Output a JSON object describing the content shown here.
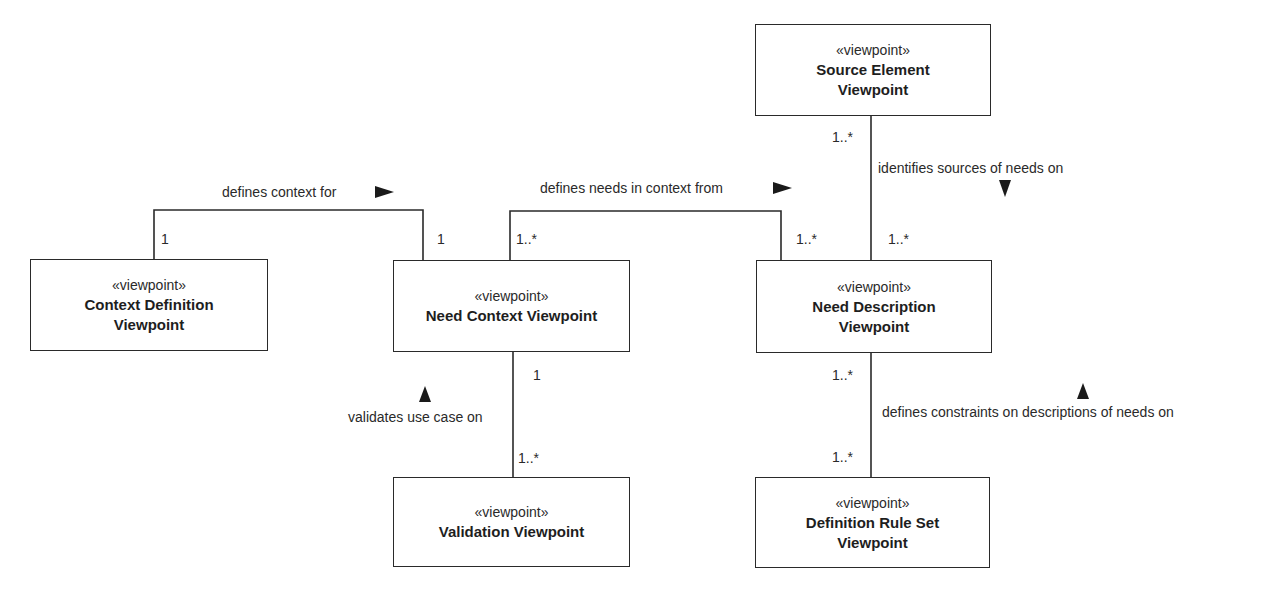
{
  "diagram": {
    "type": "uml-viewpoint-relationships",
    "stereotype": "«viewpoint»",
    "colors": {
      "line": "#2a2a2a",
      "text": "#1e1e1e",
      "background": "#ffffff",
      "arrow": "#1a1a1a"
    },
    "nodes": [
      {
        "id": "context_definition",
        "name": "Context Definition\nViewpoint"
      },
      {
        "id": "need_context",
        "name": "Need Context Viewpoint"
      },
      {
        "id": "source_element",
        "name": "Source Element\nViewpoint"
      },
      {
        "id": "need_description",
        "name": "Need Description\nViewpoint"
      },
      {
        "id": "validation",
        "name": "Validation Viewpoint"
      },
      {
        "id": "definition_rule_set",
        "name": "Definition Rule Set\nViewpoint"
      }
    ],
    "edges": [
      {
        "from": "context_definition",
        "to": "need_context",
        "label": "defines context for",
        "direction": "right",
        "mult_from": "1",
        "mult_to": "1"
      },
      {
        "from": "need_context",
        "to": "need_description",
        "label": "defines needs in context from",
        "direction": "right",
        "mult_from": "1..*",
        "mult_to": "1..*"
      },
      {
        "from": "source_element",
        "to": "need_description",
        "label": "identifies sources of needs on",
        "direction": "down",
        "mult_from": "1..*",
        "mult_to": "1..*"
      },
      {
        "from": "need_context",
        "to": "validation",
        "label": "validates use case on",
        "direction": "up",
        "mult_from": "1",
        "mult_to": "1..*"
      },
      {
        "from": "need_description",
        "to": "definition_rule_set",
        "label": "defines constraints on descriptions of needs on",
        "direction": "up",
        "mult_from": "1..*",
        "mult_to": "1..*"
      }
    ]
  }
}
